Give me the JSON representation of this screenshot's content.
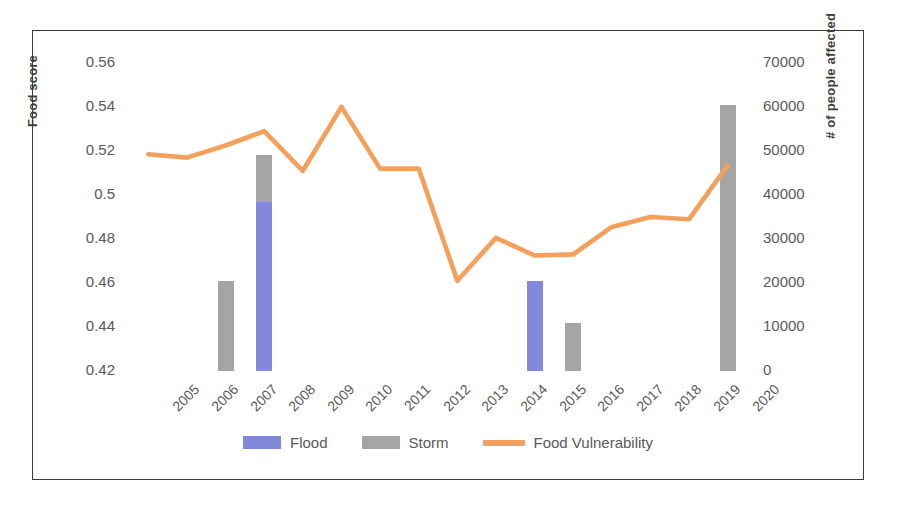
{
  "chart_data": {
    "type": "bar",
    "title": "",
    "xlabel": "",
    "ylabel": "Food score",
    "y2label": "# of people affected",
    "categories": [
      "2005",
      "2006",
      "2007",
      "2008",
      "2009",
      "2010",
      "2011",
      "2012",
      "2013",
      "2014",
      "2015",
      "2016",
      "2017",
      "2018",
      "2019",
      "2020"
    ],
    "ylim": [
      0.42,
      0.56
    ],
    "yticks": [
      "0.42",
      "0.44",
      "0.46",
      "0.48",
      "0.5",
      "0.52",
      "0.54",
      "0.56"
    ],
    "ytick_values": [
      0.42,
      0.44,
      0.46,
      0.48,
      0.5,
      0.52,
      0.54,
      0.56
    ],
    "y2lim": [
      0,
      70000
    ],
    "y2ticks": [
      "0",
      "10000",
      "20000",
      "30000",
      "40000",
      "50000",
      "60000",
      "70000"
    ],
    "y2tick_values": [
      0,
      10000,
      20000,
      30000,
      40000,
      50000,
      60000,
      70000
    ],
    "grid": false,
    "legend_position": "bottom",
    "stacked": true,
    "series": [
      {
        "name": "Flood",
        "type": "bar",
        "axis": "right",
        "color": "#8289d8",
        "values": [
          0,
          0,
          0,
          38500,
          0,
          0,
          0,
          0,
          0,
          0,
          20500,
          0,
          0,
          0,
          0,
          0
        ]
      },
      {
        "name": "Storm",
        "type": "bar",
        "axis": "right",
        "color": "#a5a5a5",
        "values": [
          0,
          0,
          20500,
          10500,
          0,
          0,
          0,
          0,
          0,
          0,
          0,
          11000,
          0,
          0,
          0,
          60500
        ]
      },
      {
        "name": "Food Vulnerability",
        "type": "line",
        "axis": "left",
        "color": "#f4a05a",
        "values": [
          0.5185,
          0.517,
          0.5225,
          0.529,
          0.511,
          0.54,
          0.512,
          0.512,
          0.461,
          0.4805,
          0.4725,
          0.473,
          0.4855,
          0.49,
          0.489,
          0.5135
        ]
      }
    ]
  },
  "legend": {
    "items": [
      {
        "label": "Flood",
        "kind": "swatch",
        "color": "#8289d8"
      },
      {
        "label": "Storm",
        "kind": "swatch",
        "color": "#a5a5a5"
      },
      {
        "label": "Food Vulnerability",
        "kind": "line",
        "color": "#f4a05a"
      }
    ]
  }
}
